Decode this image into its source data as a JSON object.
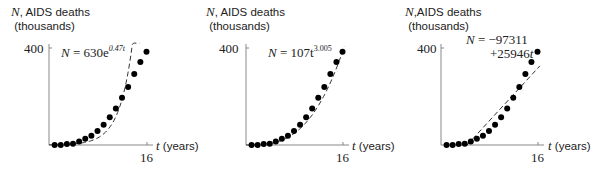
{
  "chart_data": [
    {
      "type": "scatter",
      "title": "",
      "ylabel_var": "N",
      "ylabel": ", AIDS deaths",
      "ylabel_unit": "(thousands)",
      "xlabel_var": "t",
      "xlabel": " (years)",
      "y_tick": "400",
      "x_tick": "16",
      "ylim": [
        0,
        400
      ],
      "xlim": [
        0,
        16
      ],
      "x": [
        1,
        2,
        3,
        4,
        5,
        6,
        7,
        8,
        9,
        10,
        11,
        12,
        13,
        14,
        15,
        16
      ],
      "values": [
        0,
        0,
        4,
        5,
        14,
        26,
        38,
        58,
        84,
        114,
        151,
        195,
        239,
        293,
        342,
        385
      ],
      "fit": {
        "type": "exponential",
        "equation": "N = 630e^{0.47t}",
        "lhs": "N",
        "coef": "= 630e",
        "exp": "0.47t",
        "style": "dashed"
      }
    },
    {
      "type": "scatter",
      "title": "",
      "ylabel_var": "N",
      "ylabel": ", AIDS deaths",
      "ylabel_unit": "(thousands)",
      "xlabel_var": "t",
      "xlabel": " (years)",
      "y_tick": "400",
      "x_tick": "16",
      "ylim": [
        0,
        400
      ],
      "xlim": [
        0,
        16
      ],
      "x": [
        1,
        2,
        3,
        4,
        5,
        6,
        7,
        8,
        9,
        10,
        11,
        12,
        13,
        14,
        15,
        16
      ],
      "values": [
        0,
        0,
        4,
        5,
        14,
        26,
        38,
        58,
        84,
        114,
        151,
        195,
        239,
        293,
        342,
        385
      ],
      "fit": {
        "type": "power",
        "equation": "N = 107t^{3.005}",
        "lhs": "N",
        "coef": "= 107t",
        "exp": "3.005",
        "style": "dashed"
      }
    },
    {
      "type": "scatter",
      "title": "",
      "ylabel_var": "N",
      "ylabel": ",AIDS deaths",
      "ylabel_unit": "(thousands)",
      "xlabel_var": "t",
      "xlabel": " (years)",
      "y_tick": "400",
      "x_tick": "16",
      "ylim": [
        0,
        400
      ],
      "xlim": [
        0,
        16
      ],
      "x": [
        1,
        2,
        3,
        4,
        5,
        6,
        7,
        8,
        9,
        10,
        11,
        12,
        13,
        14,
        15,
        16
      ],
      "values": [
        0,
        0,
        4,
        5,
        14,
        26,
        38,
        58,
        84,
        114,
        151,
        195,
        239,
        293,
        342,
        385
      ],
      "fit": {
        "type": "linear",
        "equation": "N = -97311 +25946t",
        "line1_lhs": "N",
        "line1": "= −97311",
        "line2": "+25946",
        "line2_var": "t",
        "style": "dashed"
      }
    }
  ]
}
